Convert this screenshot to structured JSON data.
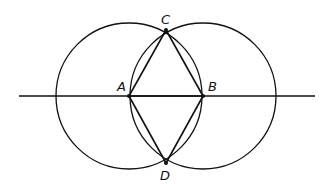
{
  "diagram": {
    "stroke_color": "#111111",
    "background": "#ffffff",
    "line": {
      "x1": 19,
      "y1": 96,
      "x2": 315,
      "y2": 96
    },
    "circles": [
      {
        "name": "circle-A",
        "cx": 129,
        "cy": 96,
        "r": 73
      },
      {
        "name": "circle-B",
        "cx": 203,
        "cy": 96,
        "r": 73
      }
    ],
    "points": [
      {
        "id": "A",
        "label": "A",
        "x": 129,
        "y": 96,
        "lx": 117,
        "ly": 91
      },
      {
        "id": "B",
        "label": "B",
        "x": 203,
        "y": 96,
        "lx": 208,
        "ly": 91
      },
      {
        "id": "C",
        "label": "C",
        "x": 166,
        "y": 30,
        "lx": 161,
        "ly": 24
      },
      {
        "id": "D",
        "label": "D",
        "x": 166,
        "y": 163,
        "lx": 160,
        "ly": 180
      }
    ],
    "segments": [
      [
        "A",
        "C"
      ],
      [
        "C",
        "B"
      ],
      [
        "B",
        "D"
      ],
      [
        "D",
        "A"
      ],
      [
        "A",
        "B"
      ]
    ]
  }
}
